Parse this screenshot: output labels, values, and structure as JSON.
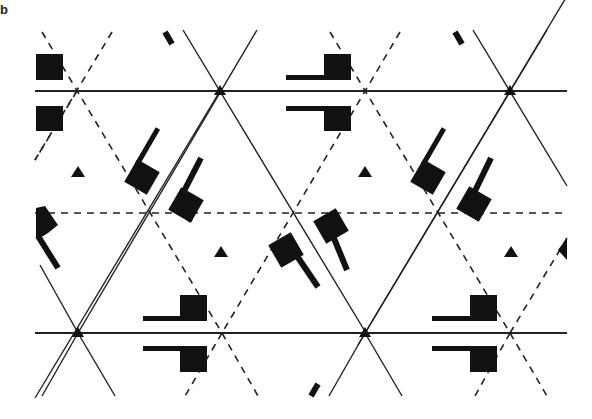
{
  "figure": {
    "panel_label": "b",
    "colors": {
      "ink": "#111111",
      "line": "#222222",
      "background": "#ffffff"
    }
  },
  "lattice": {
    "solid_horizontal_lines_y": [
      91,
      333
    ],
    "dashed_horizontal_lines_y": [
      213
    ],
    "x_range": [
      35,
      567
    ],
    "solid_vertices": [
      [
        220,
        91
      ],
      [
        510,
        91
      ],
      [
        78,
        333
      ],
      [
        365,
        333
      ]
    ],
    "dashed_vertices": [
      [
        77,
        91
      ],
      [
        365,
        91
      ],
      [
        222,
        333
      ],
      [
        510,
        333
      ]
    ],
    "small_triangles": [
      [
        78,
        173
      ],
      [
        365,
        173
      ],
      [
        222,
        253
      ],
      [
        512,
        253
      ]
    ]
  },
  "motifs": {
    "square_pairs_top": [
      "left-edge squares at x≈50",
      "flags at x≈310-350"
    ],
    "square_pairs_bottom": [
      "flags at x≈145-205",
      "flags at x≈432-497"
    ]
  }
}
